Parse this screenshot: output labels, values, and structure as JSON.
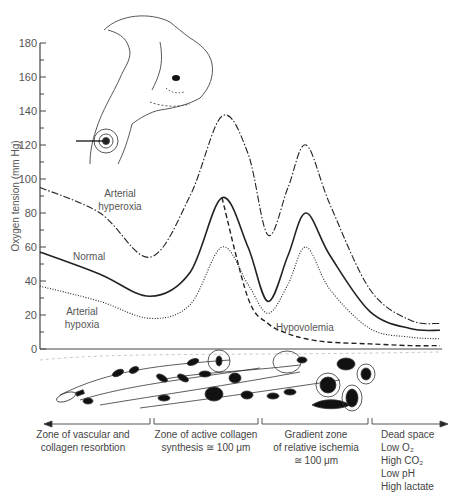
{
  "figure": {
    "y_axis": {
      "title": "Oxygen tension (mm Hg)",
      "ticks": [
        "0",
        "20",
        "40",
        "60",
        "80",
        "100",
        "120",
        "140",
        "160",
        "180"
      ]
    },
    "curve_labels": {
      "hyperoxia_line1": "Arterial",
      "hyperoxia_line2": "hyperoxia",
      "normal": "Normal",
      "hypoxia_line1": "Arterial",
      "hypoxia_line2": "hypoxia",
      "hypovolemia": "Hypovolemia"
    },
    "zones": [
      {
        "lines": [
          "Zone of vascular and",
          "collagen resorbtion"
        ]
      },
      {
        "lines": [
          "Zone of active collagen",
          "synthesis ≅ 100 μm"
        ]
      },
      {
        "lines": [
          "Gradient zone",
          "of relative ischemia",
          "≅ 100 μm"
        ]
      }
    ],
    "dead_space": {
      "title": "Dead space",
      "items": [
        "Low O₂",
        "High CO₂",
        "Low pH",
        "High lactate"
      ]
    },
    "illustrations": [
      "rabbit-ear-chamber-illustration",
      "wound-tissue-histology-strip"
    ]
  },
  "chart_data": {
    "type": "line",
    "title": "",
    "xlabel": "Distance across wound (zones)",
    "ylabel": "Oxygen tension (mm Hg)",
    "ylim": [
      0,
      180
    ],
    "yticks": [
      0,
      20,
      40,
      60,
      80,
      100,
      120,
      140,
      160,
      180
    ],
    "grid": false,
    "x_positions_px": [
      40,
      100,
      150,
      190,
      222,
      248,
      268,
      288,
      306,
      330,
      370,
      410,
      440
    ],
    "series": [
      {
        "name": "Arterial hyperoxia",
        "style": "dash-dot",
        "values": [
          95,
          80,
          54,
          90,
          137,
          115,
          67,
          95,
          120,
          85,
          35,
          17,
          15
        ]
      },
      {
        "name": "Normal",
        "style": "solid",
        "values": [
          57,
          44,
          31,
          45,
          89,
          60,
          28,
          55,
          80,
          55,
          22,
          12,
          11
        ]
      },
      {
        "name": "Arterial hypoxia",
        "style": "dotted",
        "values": [
          37,
          28,
          18,
          26,
          60,
          38,
          21,
          38,
          60,
          35,
          12,
          7,
          6
        ]
      },
      {
        "name": "Hypovolemia",
        "style": "dashed",
        "values": [
          null,
          null,
          null,
          null,
          89,
          30,
          15,
          9,
          6,
          4,
          3,
          2,
          2
        ]
      }
    ]
  }
}
